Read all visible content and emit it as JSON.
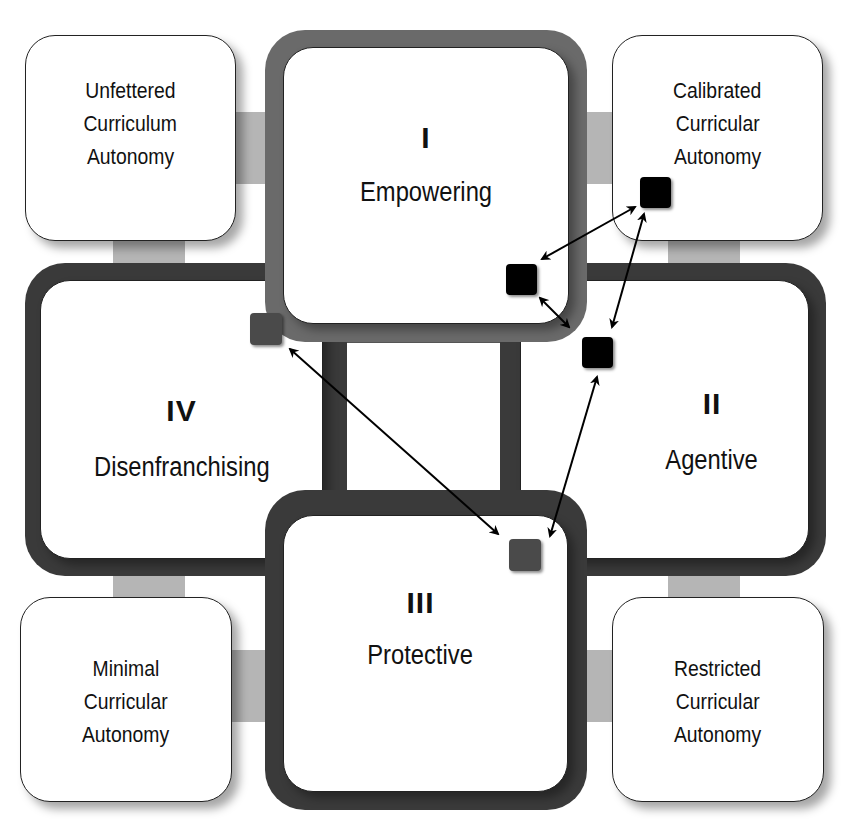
{
  "diagram": {
    "quadrants": [
      {
        "id": "I",
        "numeral": "I",
        "label": "Empowering"
      },
      {
        "id": "II",
        "numeral": "II",
        "label": "Agentive"
      },
      {
        "id": "III",
        "numeral": "III",
        "label": "Protective"
      },
      {
        "id": "IV",
        "numeral": "IV",
        "label": "Disenfranchising"
      }
    ],
    "corner_boxes": {
      "top_left": [
        "Unfettered",
        "Curriculum",
        "Autonomy"
      ],
      "top_right": [
        "Calibrated",
        "Curricular",
        "Autonomy"
      ],
      "bottom_left": [
        "Minimal",
        "Curricular",
        "Autonomy"
      ],
      "bottom_right": [
        "Restricted",
        "Curricular",
        "Autonomy"
      ]
    },
    "markers": [
      {
        "name": "marker-empowering",
        "color": "#000000"
      },
      {
        "name": "marker-calibrated",
        "color": "#000000"
      },
      {
        "name": "marker-agentive",
        "color": "#000000"
      },
      {
        "name": "marker-disenfranchising",
        "color": "#4a4a4a"
      },
      {
        "name": "marker-protective",
        "color": "#4a4a4a"
      }
    ],
    "arrows": [
      {
        "from": "marker-empowering",
        "to": "marker-calibrated",
        "type": "bidirectional"
      },
      {
        "from": "marker-empowering",
        "to": "marker-agentive",
        "type": "bidirectional"
      },
      {
        "from": "marker-calibrated",
        "to": "marker-agentive",
        "type": "bidirectional"
      },
      {
        "from": "marker-agentive",
        "to": "marker-protective",
        "type": "bidirectional"
      },
      {
        "from": "marker-disenfranchising",
        "to": "marker-protective",
        "type": "bidirectional"
      }
    ],
    "colors": {
      "frame_dark": "#3a3a3a",
      "frame_mid": "#6a6a6a",
      "connector": "#b5b5b5",
      "marker_black": "#000000",
      "marker_gray": "#4a4a4a"
    }
  }
}
